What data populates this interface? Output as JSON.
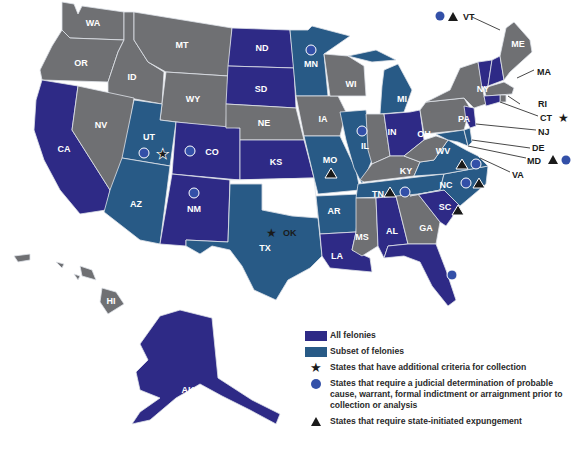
{
  "colors": {
    "all_felonies": "#2e2a86",
    "subset_of_felonies": "#285a86",
    "other": "#6f7073",
    "ok": "#ffffff",
    "circle": "#3350a8",
    "background": "#ffffff"
  },
  "states": {
    "WA": "WA",
    "OR": "OR",
    "CA": "CA",
    "ID": "ID",
    "NV": "NV",
    "MT": "MT",
    "WY": "WY",
    "UT": "UT",
    "AZ": "AZ",
    "CO": "CO",
    "NM": "NM",
    "ND": "ND",
    "SD": "SD",
    "NE": "NE",
    "KS": "KS",
    "OK": "OK",
    "TX": "TX",
    "MN": "MN",
    "IA": "IA",
    "MO": "MO",
    "AR": "AR",
    "LA": "LA",
    "WI": "WI",
    "IL": "IL",
    "MI": "MI",
    "IN": "IN",
    "OH": "OH",
    "KY": "KY",
    "TN": "TN",
    "MS": "MS",
    "AL": "AL",
    "GA": "GA",
    "FL": "FL",
    "SC": "SC",
    "NC": "NC",
    "VA": "VA",
    "WV": "WV",
    "PA": "PA",
    "NY": "NY",
    "VT": "VT",
    "NH": "NH",
    "ME": "ME",
    "MA": "MA",
    "RI": "RI",
    "CT": "CT",
    "NJ": "NJ",
    "DE": "DE",
    "MD": "MD",
    "AK": "AK",
    "HI": "HI"
  },
  "state_categories": {
    "all_felonies": [
      "CA",
      "ND",
      "SD",
      "KS",
      "CO",
      "NM",
      "OH",
      "AL",
      "LA",
      "FL",
      "SC",
      "VT",
      "NH",
      "CT",
      "NJ",
      "AK"
    ],
    "subset_of_felonies": [
      "UT",
      "AZ",
      "TX",
      "MN",
      "MI",
      "IL",
      "MO",
      "AR",
      "TN",
      "NC",
      "VA",
      "MD",
      "DE"
    ],
    "none": [
      "WA",
      "OR",
      "ID",
      "NV",
      "MT",
      "WY",
      "NE",
      "IA",
      "WI",
      "IN",
      "KY",
      "MS",
      "GA",
      "WV",
      "PA",
      "NY",
      "ME",
      "MA",
      "RI",
      "HI"
    ],
    "unshaded": [
      "OK"
    ]
  },
  "markers": {
    "star": [
      "UT",
      "OK",
      "CT"
    ],
    "circle": [
      "UT",
      "CO",
      "NM",
      "MN",
      "IL",
      "TN",
      "NC",
      "VA",
      "FL",
      "VT",
      "MD"
    ],
    "triangle": [
      "MO",
      "TN",
      "NC",
      "VA",
      "SC",
      "VT",
      "MD"
    ]
  },
  "legend": {
    "items": [
      {
        "symbol": "swatch-all",
        "label": "All felonies"
      },
      {
        "symbol": "swatch-subset",
        "label": "Subset of felonies"
      },
      {
        "symbol": "star",
        "label": "States that have additional criteria for collection"
      },
      {
        "symbol": "circle",
        "label": "States that require a judicial determination of probable cause, warrant, formal indictment or arraignment prior to collection or analysis"
      },
      {
        "symbol": "triangle",
        "label": "States that require state-initiated expungement"
      }
    ]
  },
  "icons": {
    "star": "★",
    "circle": "●",
    "triangle": "▲"
  }
}
